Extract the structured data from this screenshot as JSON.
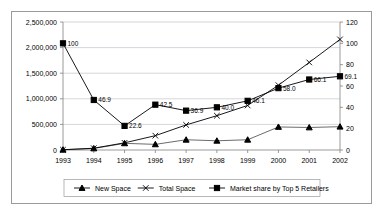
{
  "chart_data": {
    "type": "line",
    "title": "",
    "subtitle": "",
    "xlabel": "",
    "ylabel": "",
    "y2label": "",
    "grid": true,
    "legend_position": "bottom",
    "categories": [
      "1993",
      "1994",
      "1995",
      "1996",
      "1997",
      "1998",
      "1999",
      "2000",
      "2001",
      "2002"
    ],
    "xticklabels": [
      "1993",
      "1994",
      "1995",
      "1996",
      "1997",
      "1998",
      "1999",
      "2000",
      "2001",
      "2002"
    ],
    "yticklabels": [
      "0",
      "500,000",
      "1,000,000",
      "1,500,000",
      "2,000,000",
      "2,500,000"
    ],
    "y2ticklabels": [
      "0",
      "20",
      "40",
      "60",
      "80",
      "100",
      "120"
    ],
    "ylim": [
      0,
      2500000
    ],
    "y2lim": [
      0,
      120
    ],
    "series": [
      {
        "name": "New Space",
        "axis": "left",
        "marker": "triangle",
        "values": [
          5000,
          30000,
          130000,
          110000,
          200000,
          180000,
          200000,
          450000,
          440000,
          455000
        ]
      },
      {
        "name": "Total Space",
        "axis": "left",
        "marker": "x",
        "values": [
          5000,
          35000,
          140000,
          280000,
          490000,
          670000,
          870000,
          1265000,
          1710000,
          2160000
        ]
      },
      {
        "name": "Market share by Top 5 Retailers",
        "axis": "right",
        "marker": "square",
        "values": [
          100,
          46.9,
          22.6,
          42.5,
          36.9,
          40.0,
          46.1,
          58.0,
          66.1,
          69.1
        ],
        "datalabels": [
          "100",
          "46.9",
          "22.6",
          "42.5",
          "36.9",
          "40.0",
          "46.1",
          "58.0",
          "66.1",
          "69.1"
        ]
      }
    ],
    "legend": [
      {
        "label": "New Space",
        "marker": "triangle"
      },
      {
        "label": "Total Space",
        "marker": "x"
      },
      {
        "label": "Market share by Top 5 Retailers",
        "marker": "square"
      }
    ]
  },
  "colors": {
    "series_line": "#000000",
    "grid": "#b8b8c4",
    "axis": "#808080",
    "frame": "#9a9a9a",
    "background": "#ffffff"
  }
}
